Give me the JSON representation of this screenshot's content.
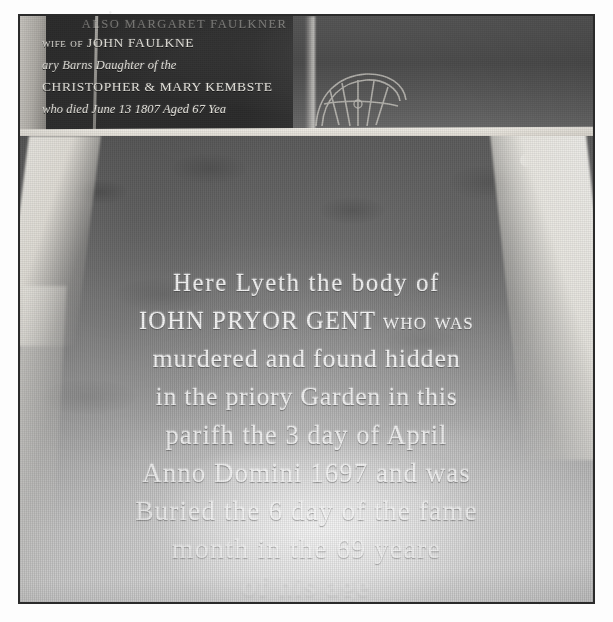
{
  "photograph": {
    "subject": "memorial ledger stone inscriptions",
    "upper_slab": {
      "name": "upper-memorial-slab",
      "inscription_lines": [
        "ALSO MARGARET FAULKNER",
        "wife of JOHN FAULKNE",
        "ary Barns Daughter of the",
        "CHRISTOPHER & MARY KEMBSTE",
        "who died June 13 1807 Aged 67 Yea"
      ],
      "ornament": "carved-rosette"
    },
    "main_slab": {
      "name": "main-ledger-slab",
      "inscription_lines": [
        "Here Lyeth the body of",
        "IOHN PRYOR GENT who was",
        "murdered and found hidden",
        "in the priory Garden in this",
        "parifh the 3 day of April",
        "Anno Domini 1697 and was",
        "Buried the 6 day of the fame",
        "month in the 69 yeare",
        "of his age"
      ],
      "superscripts": {
        "buried_day": "th",
        "yeare": "th"
      }
    }
  },
  "colors": {
    "page_background": "#fdfdfd",
    "photo_border": "#2b2b2b",
    "upper_slab_stone": "#2e2e2e",
    "main_slab_stone": "#8a8a8a",
    "mortar": "#efece5",
    "inscription_text": "#fbfbfb"
  }
}
